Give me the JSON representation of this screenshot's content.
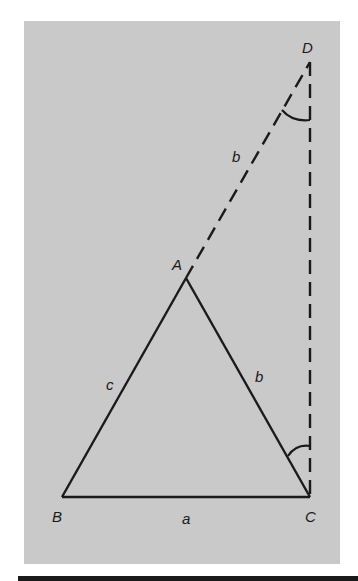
{
  "figure": {
    "top_caption_fragment": "",
    "background_color": "#c9c9c9",
    "line_color": "#1a1a1a",
    "points": {
      "A": {
        "label": "A",
        "x": 186,
        "y": 278
      },
      "B": {
        "label": "B",
        "x": 62,
        "y": 497
      },
      "C": {
        "label": "C",
        "x": 310,
        "y": 497
      },
      "D": {
        "label": "D",
        "x": 310,
        "y": 62
      }
    },
    "side_labels": {
      "a": "a",
      "b_lower": "b",
      "c": "c",
      "b_upper": "b"
    },
    "segments": [
      {
        "from": "A",
        "to": "B",
        "style": "solid"
      },
      {
        "from": "B",
        "to": "C",
        "style": "solid"
      },
      {
        "from": "C",
        "to": "A",
        "style": "solid"
      },
      {
        "from": "A",
        "to": "D",
        "style": "dashed"
      },
      {
        "from": "D",
        "to": "C",
        "style": "dashed"
      }
    ],
    "angle_marks": [
      "angle-at-D",
      "angle-at-C"
    ]
  }
}
